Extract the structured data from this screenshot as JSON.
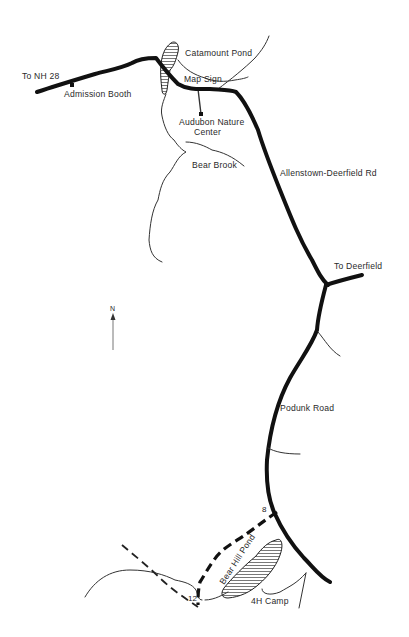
{
  "map": {
    "labels": {
      "to_nh28": "To NH 28",
      "admission_booth": "Admission Booth",
      "catamount_pond": "Catamount Pond",
      "map_sign": "Map Sign",
      "audubon_line1": "Audubon Nature",
      "audubon_line2": "Center",
      "bear_brook": "Bear Brook",
      "allenstown_rd": "Allenstown-Deerfield Rd",
      "to_deerfield": "To Deerfield",
      "podunk_road": "Podunk Road",
      "bear_hill_pond": "Bear Hill Pond",
      "camp_4h": "4H Camp"
    },
    "trail_markers": {
      "marker_8": "8",
      "marker_12": "12"
    },
    "north_arrow": "N",
    "colors": {
      "ink": "#111111",
      "background": "#ffffff"
    }
  }
}
